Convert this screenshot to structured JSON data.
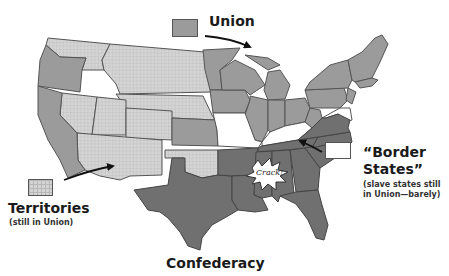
{
  "map": {
    "subject": "United States during the Civil War",
    "colors": {
      "union": "#9b9b9b",
      "confederacy": "#707070",
      "territories": "#d4d4d4",
      "border_states": "#ffffff",
      "outline": "#555555"
    }
  },
  "legend": {
    "union": {
      "label": "Union"
    },
    "territories": {
      "label": "Territories",
      "sublabel": "(still in Union)"
    },
    "border_states": {
      "label_line1": "“Border",
      "label_line2": "States”",
      "sublabel_line1": "(slave states still",
      "sublabel_line2": "in Union—barely)"
    },
    "confederacy": {
      "label": "Confederacy"
    }
  },
  "annotations": {
    "crack": "Crack!"
  }
}
